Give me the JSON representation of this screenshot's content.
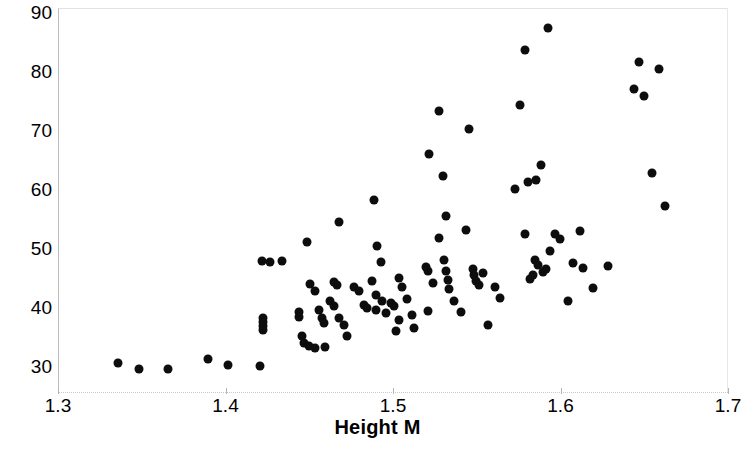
{
  "chart_data": {
    "type": "scatter",
    "title": "",
    "xlabel": "Height M",
    "ylabel": "Weight kg",
    "xlim": [
      1.3,
      1.7
    ],
    "ylim": [
      25.5,
      90.6
    ],
    "x_ticks": [
      1.3,
      1.4,
      1.5,
      1.6,
      1.7
    ],
    "x_tick_labels": [
      "1.3",
      "1.4",
      "1.5",
      "1.6",
      "1.7"
    ],
    "y_ticks": [
      30,
      40,
      50,
      60,
      70,
      80,
      90
    ],
    "y_tick_labels": [
      "30",
      "40",
      "50",
      "60",
      "70",
      "80",
      "90"
    ],
    "grid": false,
    "legend": null,
    "marker_color": "#0d0d0d",
    "marker_shape": "circle",
    "n_points": 110,
    "points": [
      [
        1.335,
        30.7
      ],
      [
        1.348,
        29.6
      ],
      [
        1.365,
        29.6
      ],
      [
        1.389,
        31.3
      ],
      [
        1.401,
        30.3
      ],
      [
        1.42,
        30.2
      ],
      [
        1.421,
        48.0
      ],
      [
        1.426,
        47.8
      ],
      [
        1.433,
        47.9
      ],
      [
        1.422,
        38.3
      ],
      [
        1.422,
        37.6
      ],
      [
        1.422,
        36.9
      ],
      [
        1.422,
        36.2
      ],
      [
        1.448,
        51.2
      ],
      [
        1.443,
        39.3
      ],
      [
        1.443,
        38.4
      ],
      [
        1.445,
        35.2
      ],
      [
        1.446,
        34.1
      ],
      [
        1.45,
        44.1
      ],
      [
        1.453,
        42.8
      ],
      [
        1.455,
        39.6
      ],
      [
        1.457,
        38.2
      ],
      [
        1.458,
        37.5
      ],
      [
        1.449,
        33.6
      ],
      [
        1.453,
        33.2
      ],
      [
        1.459,
        33.4
      ],
      [
        1.467,
        54.6
      ],
      [
        1.464,
        44.4
      ],
      [
        1.466,
        43.8
      ],
      [
        1.462,
        41.1
      ],
      [
        1.464,
        40.3
      ],
      [
        1.467,
        38.3
      ],
      [
        1.47,
        37.1
      ],
      [
        1.472,
        35.2
      ],
      [
        1.476,
        43.6
      ],
      [
        1.479,
        42.9
      ],
      [
        1.482,
        40.5
      ],
      [
        1.484,
        40.0
      ],
      [
        1.488,
        58.3
      ],
      [
        1.49,
        50.4
      ],
      [
        1.492,
        47.8
      ],
      [
        1.487,
        44.6
      ],
      [
        1.489,
        42.1
      ],
      [
        1.493,
        41.2
      ],
      [
        1.489,
        39.7
      ],
      [
        1.495,
        39.2
      ],
      [
        1.498,
        40.8
      ],
      [
        1.5,
        40.3
      ],
      [
        1.503,
        37.9
      ],
      [
        1.501,
        36.1
      ],
      [
        1.503,
        45.1
      ],
      [
        1.505,
        43.6
      ],
      [
        1.508,
        41.5
      ],
      [
        1.511,
        38.7
      ],
      [
        1.512,
        36.6
      ],
      [
        1.521,
        66.1
      ],
      [
        1.519,
        46.9
      ],
      [
        1.52,
        46.3
      ],
      [
        1.523,
        44.2
      ],
      [
        1.52,
        39.4
      ],
      [
        1.527,
        73.3
      ],
      [
        1.529,
        62.4
      ],
      [
        1.531,
        55.5
      ],
      [
        1.527,
        51.9
      ],
      [
        1.53,
        48.1
      ],
      [
        1.531,
        46.2
      ],
      [
        1.532,
        44.7
      ],
      [
        1.533,
        43.2
      ],
      [
        1.536,
        41.1
      ],
      [
        1.54,
        39.3
      ],
      [
        1.545,
        70.2
      ],
      [
        1.543,
        53.2
      ],
      [
        1.547,
        46.5
      ],
      [
        1.548,
        45.5
      ],
      [
        1.549,
        44.6
      ],
      [
        1.551,
        43.9
      ],
      [
        1.553,
        45.9
      ],
      [
        1.556,
        37.1
      ],
      [
        1.56,
        43.5
      ],
      [
        1.563,
        41.7
      ],
      [
        1.572,
        60.2
      ],
      [
        1.575,
        74.4
      ],
      [
        1.578,
        83.6
      ],
      [
        1.58,
        61.3
      ],
      [
        1.578,
        52.5
      ],
      [
        1.581,
        44.9
      ],
      [
        1.583,
        45.5
      ],
      [
        1.585,
        61.7
      ],
      [
        1.584,
        48.1
      ],
      [
        1.586,
        47.3
      ],
      [
        1.588,
        64.1
      ],
      [
        1.592,
        87.3
      ],
      [
        1.589,
        46.0
      ],
      [
        1.593,
        49.6
      ],
      [
        1.591,
        46.5
      ],
      [
        1.596,
        52.5
      ],
      [
        1.599,
        51.6
      ],
      [
        1.604,
        41.2
      ],
      [
        1.607,
        47.5
      ],
      [
        1.611,
        53.0
      ],
      [
        1.613,
        46.8
      ],
      [
        1.619,
        43.4
      ],
      [
        1.628,
        47.1
      ],
      [
        1.643,
        77.0
      ],
      [
        1.646,
        81.6
      ],
      [
        1.649,
        75.8
      ],
      [
        1.654,
        62.9
      ],
      [
        1.658,
        80.4
      ],
      [
        1.662,
        57.3
      ]
    ]
  },
  "axes": {
    "y_title": "Weight kg",
    "x_title": "Height M"
  }
}
